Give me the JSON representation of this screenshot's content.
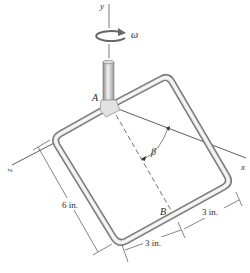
{
  "figure": {
    "axes": {
      "y_label": "y",
      "x_label": "x",
      "z_label": "z"
    },
    "rotation": {
      "symbol": "ω"
    },
    "points": {
      "A": "A",
      "B": "B"
    },
    "angle": {
      "symbol": "β"
    },
    "dimensions": {
      "side_length": "6 in.",
      "bottom_segment_1": "3 in.",
      "bottom_segment_2": "3 in."
    },
    "colors": {
      "pipe_light": "#f2f2f2",
      "pipe_dark": "#7a7a7a",
      "line": "#333333"
    }
  }
}
